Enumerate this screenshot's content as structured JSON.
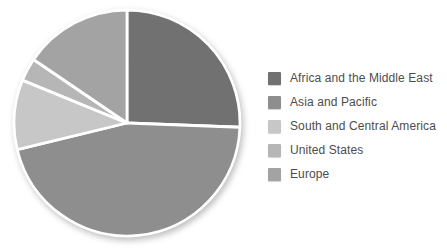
{
  "figure": {
    "background_color": "#ffffff",
    "separator_color": "#ffffff",
    "text_color": "#4d4d4d"
  },
  "chart_data": {
    "type": "pie",
    "title": "",
    "legend_position": "right",
    "legend_entries": [
      "Africa and the Middle East",
      "Asia and Pacific",
      "South and Central America",
      "United States",
      "Europe"
    ],
    "slices": [
      {
        "label": "Africa and the Middle East",
        "value": 25.6,
        "color": "#717171"
      },
      {
        "label": "Asia and Pacific",
        "value": 45.6,
        "color": "#8e8e8e"
      },
      {
        "label": "South and Central America",
        "value": 10.0,
        "color": "#c7c7c7"
      },
      {
        "label": "United States",
        "value": 3.3,
        "color": "#b6b6b6"
      },
      {
        "label": "Europe",
        "value": 15.5,
        "color": "#a3a3a3"
      }
    ],
    "units": "percent",
    "start_angle_deg": 0,
    "direction": "clockwise"
  }
}
